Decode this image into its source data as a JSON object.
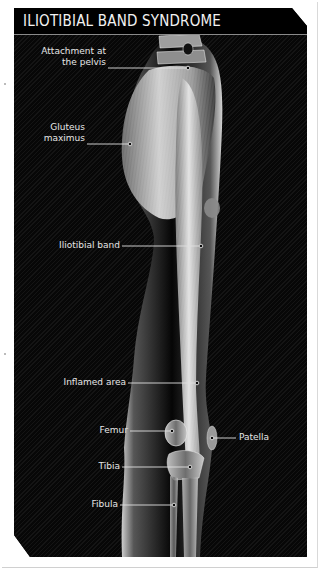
{
  "title": "ILIOTIBIAL BAND SYNDROME",
  "labels": {
    "attachment": "Attachment at\nthe pelvis",
    "attachment_line1": "Attachment at",
    "attachment_line2": "the pelvis",
    "gluteus_line1": "Gluteus",
    "gluteus_line2": "maximus",
    "it_band": "Iliotibial band",
    "inflamed": "Inflamed area",
    "femur": "Femur",
    "patella": "Patella",
    "tibia": "Tibia",
    "fibula": "Fibula"
  },
  "colors": {
    "panel_background": "#0b0b0b",
    "title_text": "#f2f2f2",
    "label_text": "#e6e6e6",
    "leader_line": "#e0e0e0"
  }
}
